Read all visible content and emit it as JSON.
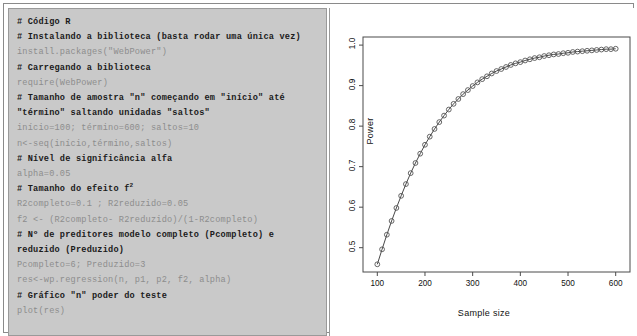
{
  "code_panel": {
    "lines": [
      {
        "text": "# Código R",
        "type": "comment"
      },
      {
        "text": "# Instalando a biblioteca (basta rodar uma única vez)",
        "type": "comment"
      },
      {
        "text": "install.packages(\"WebPower\")",
        "type": "code"
      },
      {
        "text": "# Carregando a biblioteca",
        "type": "comment"
      },
      {
        "text": "require(WebPower)",
        "type": "code"
      },
      {
        "text": "# Tamanho de amostra \"n\" começando em \"início\" até",
        "type": "comment"
      },
      {
        "text": "\"término\" saltando unidadas \"saltos\"",
        "type": "comment"
      },
      {
        "text": "início=100; término=600; saltos=10",
        "type": "code"
      },
      {
        "text": "n<-seq(início,término,saltos)",
        "type": "code"
      },
      {
        "text": "# Nível de significância alfa",
        "type": "comment"
      },
      {
        "text": "alpha=0.05",
        "type": "code"
      },
      {
        "text": "# Tamanho do efeito f",
        "type": "comment",
        "sup": "2"
      },
      {
        "text": "R2completo=0.1 ; R2reduzido=0.05",
        "type": "code"
      },
      {
        "text": "f2 <- (R2completo- R2reduzido)/(1-R2completo)",
        "type": "code"
      },
      {
        "text": "# Nº de preditores modelo completo (Pcompleto) e",
        "type": "comment"
      },
      {
        "text": "reduzido (Preduzido)",
        "type": "comment"
      },
      {
        "text": "Pcompleto=6; Preduzido=3",
        "type": "code"
      },
      {
        "text": "res<-wp.regression(n, p1, p2, f2, alpha)",
        "type": "code"
      },
      {
        "text": "# Gráfico \"n\" poder do teste",
        "type": "comment"
      },
      {
        "text": "plot(res)",
        "type": "code"
      }
    ]
  },
  "chart_data": {
    "type": "line",
    "title": "",
    "xlabel": "Sample size",
    "ylabel": "Power",
    "xlim": [
      70,
      630
    ],
    "ylim": [
      0.44,
      1.02
    ],
    "xticks": [
      "100",
      "200",
      "300",
      "400",
      "500",
      "600"
    ],
    "xtick_values": [
      100,
      200,
      300,
      400,
      500,
      600
    ],
    "yticks": [
      "0.5",
      "0.6",
      "0.7",
      "0.8",
      "0.9",
      "1.0"
    ],
    "ytick_values": [
      0.5,
      0.6,
      0.7,
      0.8,
      0.9,
      1.0
    ],
    "grid": false,
    "legend": false,
    "marker": "open-circle",
    "line_color": "#333333",
    "marker_color": "#555555",
    "x": [
      100,
      110,
      120,
      130,
      140,
      150,
      160,
      170,
      180,
      190,
      200,
      210,
      220,
      230,
      240,
      250,
      260,
      270,
      280,
      290,
      300,
      310,
      320,
      330,
      340,
      350,
      360,
      370,
      380,
      390,
      400,
      410,
      420,
      430,
      440,
      450,
      460,
      470,
      480,
      490,
      500,
      510,
      520,
      530,
      540,
      550,
      560,
      570,
      580,
      590,
      600
    ],
    "y": [
      0.459,
      0.496,
      0.532,
      0.566,
      0.598,
      0.628,
      0.657,
      0.684,
      0.709,
      0.732,
      0.754,
      0.774,
      0.793,
      0.81,
      0.826,
      0.841,
      0.855,
      0.867,
      0.879,
      0.889,
      0.899,
      0.908,
      0.916,
      0.923,
      0.93,
      0.936,
      0.941,
      0.946,
      0.951,
      0.955,
      0.958,
      0.962,
      0.965,
      0.968,
      0.97,
      0.973,
      0.975,
      0.977,
      0.978,
      0.98,
      0.981,
      0.983,
      0.984,
      0.985,
      0.986,
      0.987,
      0.988,
      0.989,
      0.99,
      0.99,
      0.991
    ]
  }
}
